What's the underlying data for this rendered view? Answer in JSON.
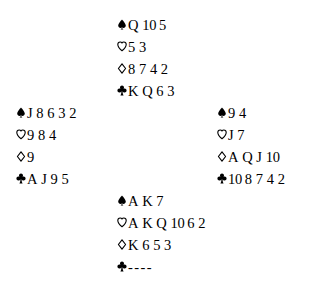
{
  "diagram": {
    "type": "bridge-deal",
    "background_color": "#ffffff",
    "ink_color": "#000000",
    "suits": {
      "spade": {
        "icon": "spade-icon",
        "symbol": "♠",
        "filled": true,
        "label": "Spades"
      },
      "heart": {
        "icon": "heart-icon",
        "symbol": "♡",
        "filled": false,
        "label": "Hearts"
      },
      "diamond": {
        "icon": "diamond-icon",
        "symbol": "♢",
        "filled": false,
        "label": "Diamonds"
      },
      "club": {
        "icon": "club-icon",
        "symbol": "♣",
        "filled": true,
        "label": "Clubs"
      }
    },
    "void_marker": "----"
  },
  "hands": {
    "north": {
      "position": "North",
      "spades": [
        "Q",
        "10",
        "5"
      ],
      "hearts": [
        "5",
        "3"
      ],
      "diamonds": [
        "8",
        "7",
        "4",
        "2"
      ],
      "clubs": [
        "K",
        "Q",
        "6",
        "3"
      ]
    },
    "west": {
      "position": "West",
      "spades": [
        "J",
        "8",
        "6",
        "3",
        "2"
      ],
      "hearts": [
        "9",
        "8",
        "4"
      ],
      "diamonds": [
        "9"
      ],
      "clubs": [
        "A",
        "J",
        "9",
        "5"
      ]
    },
    "east": {
      "position": "East",
      "spades": [
        "9",
        "4"
      ],
      "hearts": [
        "J",
        "7"
      ],
      "diamonds": [
        "A",
        "Q",
        "J",
        "10"
      ],
      "clubs": [
        "10",
        "8",
        "7",
        "4",
        "2"
      ]
    },
    "south": {
      "position": "South",
      "spades": [
        "A",
        "K",
        "7"
      ],
      "hearts": [
        "A",
        "K",
        "Q",
        "10",
        "6",
        "2"
      ],
      "diamonds": [
        "K",
        "6",
        "5",
        "3"
      ],
      "clubs": []
    }
  }
}
